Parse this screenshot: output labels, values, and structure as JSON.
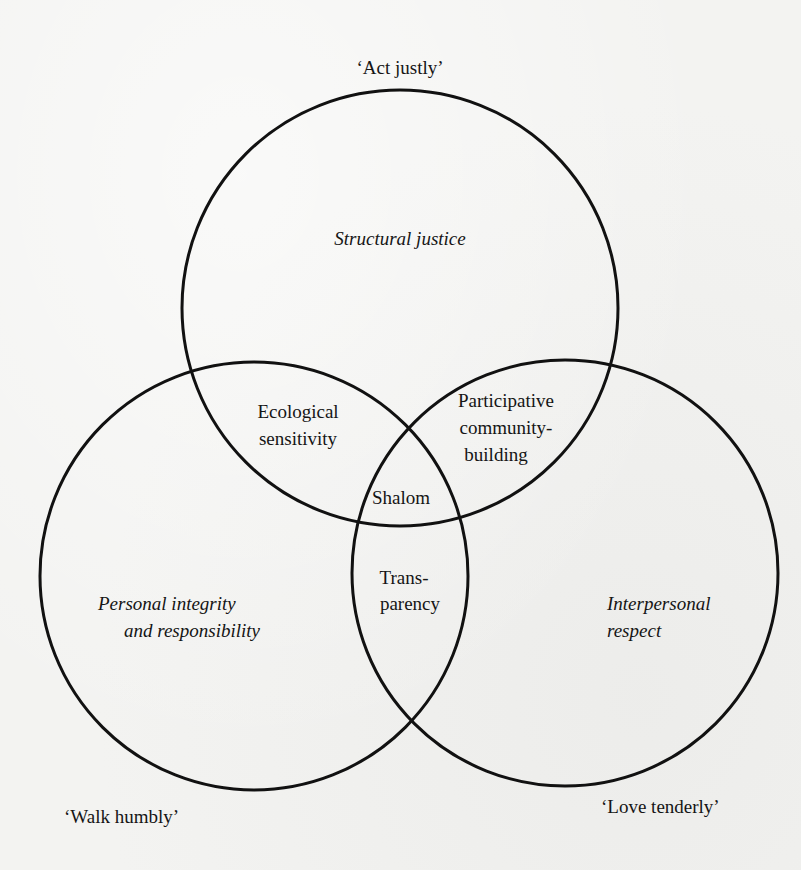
{
  "diagram": {
    "type": "venn",
    "circles": [
      {
        "id": "top",
        "cx": 400,
        "cy": 308,
        "r": 218,
        "label": "'Act justly'",
        "region_label": "Structural justice"
      },
      {
        "id": "left",
        "cx": 254,
        "cy": 576,
        "r": 214,
        "label": "'Walk humbly'",
        "region_label_line1": "Personal integrity",
        "region_label_line2": "and responsibility"
      },
      {
        "id": "right",
        "cx": 565,
        "cy": 573,
        "r": 213,
        "label": "'Love tenderly'",
        "region_label_line1": "Interpersonal",
        "region_label_line2": "respect"
      }
    ],
    "stroke_color": "#111111",
    "stroke_width": 3
  },
  "labels": {
    "act_justly": "‘Act justly’",
    "walk_humbly": "‘Walk humbly’",
    "love_tenderly": "‘Love tenderly’",
    "structural_justice": "Structural justice",
    "personal_integrity_line1": "Personal integrity",
    "personal_integrity_line2": "and responsibility",
    "interpersonal_line1": "Interpersonal",
    "interpersonal_line2": "respect",
    "ecological_line1": "Ecological",
    "ecological_line2": "sensitivity",
    "participative_line1": "Participative",
    "participative_line2": "community-",
    "participative_line3": "building",
    "shalom": "Shalom",
    "transparency_line1": "Trans-",
    "transparency_line2": "parency"
  }
}
